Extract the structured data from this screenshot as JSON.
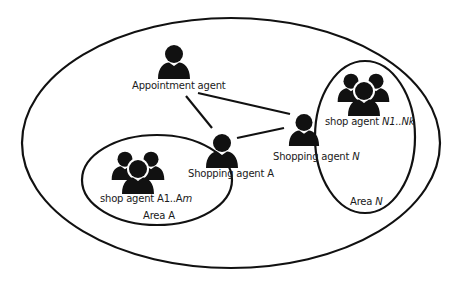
{
  "diagram": {
    "regions": [
      {
        "id": "outer",
        "label": ""
      },
      {
        "id": "area_a",
        "label": "Area A"
      },
      {
        "id": "area_n",
        "label_prefix": "Area ",
        "label_italic": "N"
      }
    ],
    "nodes": [
      {
        "id": "appointment",
        "type": "single-user",
        "label": "Appointment agent"
      },
      {
        "id": "shopping_a",
        "type": "single-user",
        "label": "Shopping agent A"
      },
      {
        "id": "shopping_n",
        "type": "single-user",
        "label_prefix": "Shopping agent ",
        "label_italic": "N"
      },
      {
        "id": "shop_a",
        "type": "user-group",
        "label_prefix": "shop agent A1..A",
        "label_italic": "m"
      },
      {
        "id": "shop_n",
        "type": "user-group",
        "label_prefix": "shop agent ",
        "label_italic": "N1..Nk"
      }
    ],
    "edges": [
      {
        "from": "appointment",
        "to": "shopping_a"
      },
      {
        "from": "appointment",
        "to": "shopping_n"
      },
      {
        "from": "shopping_a",
        "to": "shopping_n"
      }
    ],
    "colors": {
      "stroke": "#111111",
      "fill": "#111111",
      "background": "#ffffff"
    }
  }
}
